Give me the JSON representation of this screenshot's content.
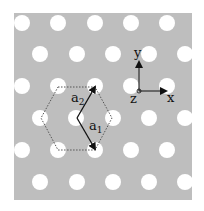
{
  "figure": {
    "type": "hexagonal-lattice-photonic-crystal",
    "background_color": "#ffffff",
    "slab": {
      "x": 14,
      "y": 13,
      "width": 178,
      "height": 187,
      "color": "#bebebe"
    },
    "hole_color": "#ffffff",
    "hole_radius": 8,
    "holes": [
      [
        22,
        23
      ],
      [
        58,
        23
      ],
      [
        95,
        23
      ],
      [
        131,
        23
      ],
      [
        167,
        23
      ],
      [
        40,
        54
      ],
      [
        77,
        54
      ],
      [
        113,
        54
      ],
      [
        149,
        54
      ],
      [
        185,
        54
      ],
      [
        22,
        86
      ],
      [
        58,
        86
      ],
      [
        95,
        86
      ],
      [
        131,
        86
      ],
      [
        167,
        86
      ],
      [
        40,
        118
      ],
      [
        76,
        118
      ],
      [
        113,
        118
      ],
      [
        149,
        118
      ],
      [
        185,
        118
      ],
      [
        22,
        150
      ],
      [
        58,
        150
      ],
      [
        95,
        150
      ],
      [
        131,
        150
      ],
      [
        167,
        150
      ],
      [
        40,
        182
      ],
      [
        77,
        182
      ],
      [
        113,
        182
      ],
      [
        149,
        182
      ],
      [
        185,
        182
      ]
    ],
    "unit_cell": {
      "shape": "hexagon",
      "style": "dotted",
      "vertices": [
        [
          58,
          87
        ],
        [
          95,
          87
        ],
        [
          112,
          118
        ],
        [
          95,
          150
        ],
        [
          58,
          150
        ],
        [
          41,
          118
        ]
      ]
    },
    "lattice_vectors": {
      "origin": [
        77,
        118
      ],
      "a1": {
        "label": "a",
        "subscript": "1",
        "end": [
          95,
          149
        ],
        "label_pos": [
          89,
          130
        ]
      },
      "a2": {
        "label": "a",
        "subscript": "2",
        "end": [
          95,
          87
        ],
        "label_pos": [
          71,
          102
        ]
      }
    },
    "axes": {
      "origin": [
        139,
        91
      ],
      "x": {
        "label": "x",
        "end": [
          166,
          91
        ],
        "label_pos": [
          167,
          102
        ]
      },
      "y": {
        "label": "y",
        "end": [
          139,
          62
        ],
        "label_pos": [
          134,
          57
        ]
      },
      "z": {
        "label": "z",
        "label_pos": [
          130,
          103
        ]
      }
    }
  }
}
